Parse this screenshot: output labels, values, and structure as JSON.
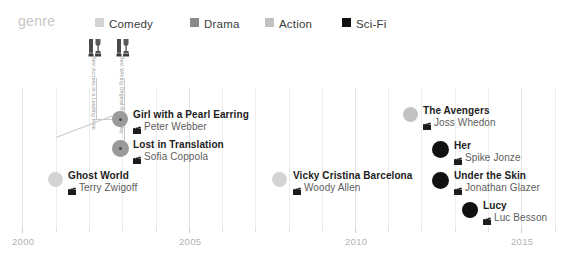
{
  "legend": {
    "title": "genre",
    "items": [
      {
        "label": "Comedy",
        "color": "#d3d3d3",
        "x": 95
      },
      {
        "label": "Drama",
        "color": "#8a8a8a",
        "x": 190
      },
      {
        "label": "Action",
        "color": "#c2c2c2",
        "x": 265
      },
      {
        "label": "Sci-Fi",
        "color": "#111111",
        "x": 342
      }
    ]
  },
  "axis": {
    "ticks": [
      {
        "label": "2000",
        "x": 22
      },
      {
        "label": "2005",
        "x": 189
      },
      {
        "label": "2010",
        "x": 355
      },
      {
        "label": "2015",
        "x": 521
      }
    ],
    "minor_tick_xs": [
      56,
      89,
      122,
      156,
      222,
      255,
      289,
      322,
      388,
      421,
      455,
      488,
      555
    ]
  },
  "grid": {
    "major_xs": [
      22,
      189,
      355,
      521
    ],
    "minor_xs": [
      56,
      89,
      122,
      156,
      222,
      255,
      289,
      322,
      388,
      421,
      455,
      488,
      555
    ],
    "top": 88,
    "bottom": 232
  },
  "awards": [
    {
      "icon_name": "oscar-trophy-icon",
      "label": "Best Actress in a Leading Role",
      "icon_x": 88,
      "icon_y": 38,
      "text_x": 97,
      "text_y": 56,
      "stem_x": 96,
      "stem_y": 78,
      "stem_h": 42
    },
    {
      "icon_name": "oscar-trophy-icon",
      "label": "Best Writing Original Screenplay",
      "icon_x": 116,
      "icon_y": 38,
      "text_x": 125,
      "text_y": 56,
      "stem_x": 124,
      "stem_y": 78,
      "stem_h": 70
    }
  ],
  "films": [
    {
      "title": "Ghost World",
      "director": "Terry Zwigoff",
      "genre": "Comedy",
      "color": "#d3d3d3",
      "dot_x": 48,
      "dot_y": 172,
      "dot_size": 15,
      "text_x": 68,
      "text_y": 170
    },
    {
      "title": "Girl with a Pearl Earring",
      "director": "Peter Webber",
      "genre": "Drama",
      "color": "#9a9a9a",
      "dot_x": 112,
      "dot_y": 111,
      "dot_size": 16,
      "text_x": 133,
      "text_y": 109,
      "has_center_dot": true
    },
    {
      "title": "Lost in Translation",
      "director": "Sofia Coppola",
      "genre": "Drama",
      "color": "#9a9a9a",
      "dot_x": 112,
      "dot_y": 140,
      "dot_size": 17,
      "text_x": 133,
      "text_y": 139,
      "has_center_dot": true
    },
    {
      "title": "Vicky Cristina Barcelona",
      "director": "Woody Allen",
      "genre": "Comedy",
      "color": "#d3d3d3",
      "dot_x": 272,
      "dot_y": 172,
      "dot_size": 15,
      "text_x": 293,
      "text_y": 170
    },
    {
      "title": "The Avengers",
      "director": "Joss Whedon",
      "genre": "Action",
      "color": "#c2c2c2",
      "dot_x": 403,
      "dot_y": 107,
      "dot_size": 15,
      "text_x": 423,
      "text_y": 105
    },
    {
      "title": "Her",
      "director": "Spike Jonze",
      "genre": "Sci-Fi",
      "color": "#111111",
      "dot_x": 432,
      "dot_y": 141,
      "dot_size": 17,
      "text_x": 454,
      "text_y": 140
    },
    {
      "title": "Under the Skin",
      "director": "Jonathan Glazer",
      "genre": "Sci-Fi",
      "color": "#111111",
      "dot_x": 432,
      "dot_y": 172,
      "dot_size": 17,
      "text_x": 454,
      "text_y": 170
    },
    {
      "title": "Lucy",
      "director": "Luc Besson",
      "genre": "Sci-Fi",
      "color": "#111111",
      "dot_x": 462,
      "dot_y": 202,
      "dot_size": 16,
      "text_x": 483,
      "text_y": 200
    }
  ],
  "connectors": [
    {
      "x": 56,
      "y": 137,
      "w": 60,
      "rot": -21
    },
    {
      "x": 96,
      "y": 119,
      "w": 20,
      "rot": 0
    }
  ],
  "icons": {
    "clapperboard": "clapperboard-icon",
    "trophy": "oscar-trophy-icon"
  },
  "chart_data": {
    "type": "scatter",
    "title": "",
    "xlabel": "",
    "ylabel": "",
    "xlim": [
      2000,
      2015
    ],
    "grid": true,
    "legend_position": "top",
    "legend_entries": [
      "Comedy",
      "Drama",
      "Action",
      "Sci-Fi"
    ],
    "points": [
      {
        "label": "Ghost World",
        "director": "Terry Zwigoff",
        "genre": "Comedy",
        "year": 2001
      },
      {
        "label": "Girl with a Pearl Earring",
        "director": "Peter Webber",
        "genre": "Drama",
        "year": 2003
      },
      {
        "label": "Lost in Translation",
        "director": "Sofia Coppola",
        "genre": "Drama",
        "year": 2003
      },
      {
        "label": "Vicky Cristina Barcelona",
        "director": "Woody Allen",
        "genre": "Comedy",
        "year": 2008
      },
      {
        "label": "The Avengers",
        "director": "Joss Whedon",
        "genre": "Action",
        "year": 2012
      },
      {
        "label": "Her",
        "director": "Spike Jonze",
        "genre": "Sci-Fi",
        "year": 2013
      },
      {
        "label": "Under the Skin",
        "director": "Jonathan Glazer",
        "genre": "Sci-Fi",
        "year": 2013
      },
      {
        "label": "Lucy",
        "director": "Luc Besson",
        "genre": "Sci-Fi",
        "year": 2014
      }
    ],
    "annotations": [
      {
        "text": "Best Actress in a Leading Role",
        "attached_to": "Lost in Translation"
      },
      {
        "text": "Best Writing Original Screenplay",
        "attached_to": "Girl with a Pearl Earring"
      }
    ]
  }
}
